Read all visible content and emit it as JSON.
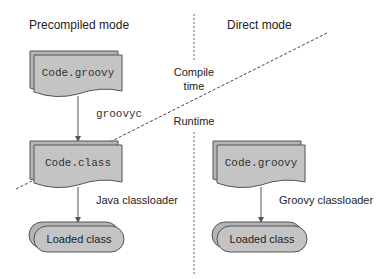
{
  "sections": {
    "left_title": "Precompiled mode",
    "right_title": "Direct mode"
  },
  "phases": {
    "compile_line1": "Compile",
    "compile_line2": "time",
    "runtime": "Runtime"
  },
  "precompiled": {
    "source_file": "Code.groovy",
    "compiler": "groovyc",
    "class_file": "Code.class",
    "loader": "Java classloader",
    "result": "Loaded class"
  },
  "direct": {
    "source_file": "Code.groovy",
    "loader": "Groovy classloader",
    "result": "Loaded class"
  },
  "colors": {
    "shape_fill": "#c4c4c4",
    "shape_back": "#b4b4b4",
    "stroke": "#555555",
    "line": "#555555"
  }
}
